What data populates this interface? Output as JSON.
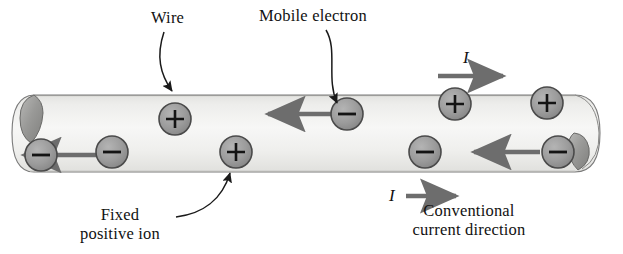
{
  "figure": {
    "title_alt": "Current in a wire: mobile electrons and fixed positive ions",
    "colors": {
      "wire_fill_light": "#f3f3f1",
      "wire_fill_mid": "#e6e6e3",
      "wire_outline": "#6f6f6f",
      "charge_fill": "#9c9c9c",
      "charge_outline": "#4a4a4a",
      "endcap_fill": "#9a9a99",
      "arrow_gray": "#6d6d6d",
      "text": "#111111"
    }
  },
  "labels": {
    "wire": "Wire",
    "mobile_electron": "Mobile electron",
    "fixed_ion_line1": "Fixed",
    "fixed_ion_line2": "positive ion",
    "conventional_line1": "Conventional",
    "conventional_line2": "current direction",
    "current_symbol_top": "I",
    "current_symbol_bottom": "I"
  },
  "charges": [
    {
      "id": "ion-1",
      "sign": "+",
      "x": 175,
      "y": 119
    },
    {
      "id": "ion-2",
      "sign": "+",
      "x": 236,
      "y": 152
    },
    {
      "id": "ion-3",
      "sign": "+",
      "x": 455,
      "y": 104
    },
    {
      "id": "ion-4",
      "sign": "+",
      "x": 547,
      "y": 103
    },
    {
      "id": "electron-1",
      "sign": "-",
      "x": 41,
      "y": 155
    },
    {
      "id": "electron-2",
      "sign": "-",
      "x": 112,
      "y": 152
    },
    {
      "id": "electron-3",
      "sign": "-",
      "x": 347,
      "y": 114
    },
    {
      "id": "electron-4",
      "sign": "-",
      "x": 425,
      "y": 152
    },
    {
      "id": "electron-5",
      "sign": "-",
      "x": 558,
      "y": 152
    }
  ],
  "drift_arrows": [
    {
      "id": "drift-1",
      "x1": 128,
      "x2": 22,
      "y": 155
    },
    {
      "id": "drift-2",
      "x1": 333,
      "x2": 266,
      "y": 114
    },
    {
      "id": "drift-3",
      "x1": 540,
      "x2": 472,
      "y": 152
    }
  ],
  "current_arrows": [
    {
      "id": "current-arrow-top",
      "x1": 438,
      "x2": 505,
      "y": 76
    },
    {
      "id": "current-arrow-bottom",
      "x1": 406,
      "x2": 458,
      "y": 196
    }
  ]
}
